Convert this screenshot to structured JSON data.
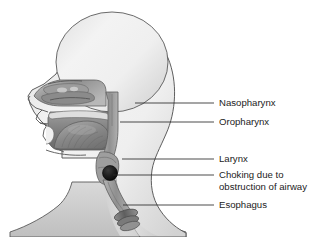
{
  "figure": {
    "background_color": "#ffffff",
    "width": 336,
    "height": 237
  },
  "labels": [
    {
      "id": "nasopharynx",
      "text": "Nasopharynx",
      "lines": [
        "Nasopharynx"
      ],
      "text_x": 219,
      "text_y": 103,
      "leader_from_x": 135,
      "leader_to_x": 214,
      "leader_y": 103
    },
    {
      "id": "oropharynx",
      "text": "Oropharynx",
      "lines": [
        "Oropharynx"
      ],
      "text_x": 219,
      "text_y": 122,
      "leader_from_x": 120,
      "leader_to_x": 214,
      "leader_y": 122
    },
    {
      "id": "larynx",
      "text": "Larynx",
      "lines": [
        "Larynx"
      ],
      "text_x": 219,
      "text_y": 159,
      "leader_from_x": 122,
      "leader_to_x": 214,
      "leader_y": 159
    },
    {
      "id": "choking",
      "text": "Choking due to obstruction of airway",
      "lines": [
        "Choking due to",
        "obstruction of airway"
      ],
      "text_x": 219,
      "text_y": 175,
      "leader_from_x": 113,
      "leader_to_x": 214,
      "leader_y": 175
    },
    {
      "id": "esophagus",
      "text": "Esophagus",
      "lines": [
        "Esophagus"
      ],
      "text_x": 219,
      "text_y": 205,
      "leader_from_x": 123,
      "leader_to_x": 214,
      "leader_y": 205
    }
  ],
  "anatomy": {
    "head_label": "head-silhouette",
    "nasal_cavity_label": "nasal-cavity",
    "oral_cavity_label": "oral-cavity",
    "tongue_label": "tongue",
    "pharynx_label": "pharynx-airway",
    "larynx_label": "larynx",
    "trachea_label": "trachea",
    "esophagus_label": "esophagus",
    "obstruction_label": "airway-obstruction-bolus",
    "obstruction_x": 110,
    "obstruction_y": 173,
    "obstruction_radius": 7.5
  },
  "colors": {
    "outline": "#555555",
    "skin_light": "#f4f4f4",
    "skin_mid": "#dcdcdc",
    "skin_shadow": "#bdbdbd",
    "cavity_dark": "#6e6e6e",
    "cavity_mid": "#9a9a9a",
    "tongue": "#8a8a8a",
    "obstruction": "#1a1a1a",
    "leader": "#2a2a2a",
    "text": "#1c1c1c"
  }
}
